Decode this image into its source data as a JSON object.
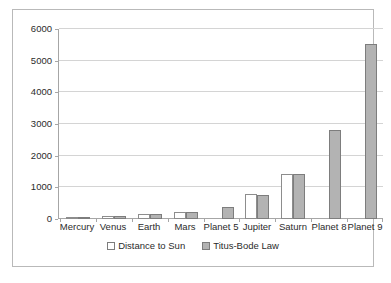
{
  "chart_data": {
    "type": "bar",
    "title": "",
    "subtitle": "",
    "xlabel": "",
    "ylabel": "",
    "ylim": [
      0,
      6000
    ],
    "yticks": [
      0,
      1000,
      2000,
      3000,
      4000,
      5000,
      6000
    ],
    "ytick_labels": [
      "0",
      "1000",
      "2000",
      "3000",
      "4000",
      "5000",
      "6000"
    ],
    "grid": true,
    "legend_position": "bottom-center",
    "orientation": "vertical",
    "grouping": "grouped",
    "categories": [
      "Mercury",
      "Venus",
      "Earth",
      "Mars",
      "Planet 5",
      "Jupiter",
      "Saturn",
      "Planet 8",
      "Planet 9"
    ],
    "series": [
      {
        "name": "Distance to Sun",
        "color": "#ffffff",
        "border_color": "#8d8d8d",
        "values": [
          58,
          108,
          150,
          228,
          null,
          778,
          1427,
          null,
          null
        ]
      },
      {
        "name": "Titus-Bode Law",
        "color": "#b3b3b3",
        "border_color": "#7d7d7d",
        "values": [
          55,
          100,
          145,
          225,
          395,
          745,
          1435,
          2800,
          5540
        ]
      }
    ],
    "annotations": []
  },
  "legend": {
    "entries": [
      {
        "label": "Distance to Sun",
        "swatch": "hollow-square-icon"
      },
      {
        "label": "Titus-Bode Law",
        "swatch": "filled-square-icon"
      }
    ]
  },
  "colors": {
    "background": "#ffffff",
    "frame_border": "#b9b9b9",
    "axis_line": "#a6a6a6",
    "gridline": "#d4d4d4",
    "text": "#2b2b2b"
  }
}
